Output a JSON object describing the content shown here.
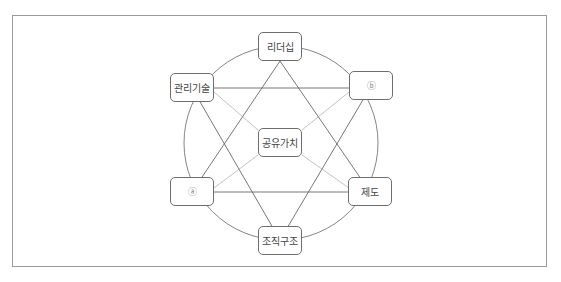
{
  "diagram": {
    "center": {
      "label": "공유가치"
    },
    "nodes": [
      {
        "id": "leadership",
        "label": "리더십"
      },
      {
        "id": "b",
        "label": "ⓑ"
      },
      {
        "id": "system",
        "label": "제도"
      },
      {
        "id": "structure",
        "label": "조직구조"
      },
      {
        "id": "a",
        "label": "ⓐ"
      },
      {
        "id": "skill",
        "label": "관리기술"
      }
    ],
    "colors": {
      "line": "#666666",
      "border": "#6e6e6e",
      "frame": "#9a9a9a"
    }
  }
}
